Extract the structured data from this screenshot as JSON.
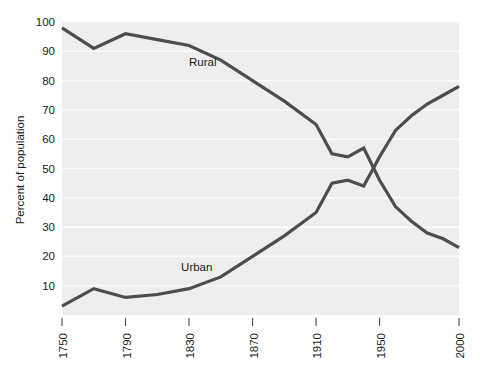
{
  "chart_data": {
    "type": "line",
    "title": "",
    "subtitle": "",
    "xlabel": "",
    "ylabel": "Percent of population",
    "xlim": [
      1750,
      2000
    ],
    "ylim": [
      0,
      100
    ],
    "grid": true,
    "legend_position": "inline-annotations",
    "x_ticks": [
      1750,
      1790,
      1830,
      1870,
      1910,
      1950,
      2000
    ],
    "x_tick_labels": [
      "1750",
      "1790",
      "1830",
      "1870",
      "1910",
      "1950",
      "2000"
    ],
    "y_ticks": [
      10,
      20,
      30,
      40,
      50,
      60,
      70,
      80,
      90,
      100
    ],
    "y_tick_labels": [
      "10",
      "20",
      "30",
      "40",
      "50",
      "60",
      "70",
      "80",
      "90",
      "100"
    ],
    "annotations": [
      {
        "text": "Rural",
        "x": 1830,
        "y": 85
      },
      {
        "text": "Urban",
        "x": 1825,
        "y": 15
      }
    ],
    "series": [
      {
        "name": "Rural",
        "label": "Rural",
        "color": "#4d4d4d",
        "x": [
          1750,
          1770,
          1790,
          1810,
          1830,
          1850,
          1870,
          1890,
          1910,
          1920,
          1930,
          1940,
          1950,
          1960,
          1970,
          1980,
          1990,
          2000
        ],
        "values": [
          98,
          91,
          96,
          94,
          92,
          87,
          80,
          73,
          65,
          55,
          54,
          57,
          46,
          37,
          32,
          28,
          26,
          23
        ]
      },
      {
        "name": "Urban",
        "label": "Urban",
        "color": "#4d4d4d",
        "x": [
          1750,
          1770,
          1790,
          1810,
          1830,
          1850,
          1870,
          1890,
          1910,
          1920,
          1930,
          1940,
          1950,
          1960,
          1970,
          1980,
          1990,
          2000
        ],
        "values": [
          3,
          9,
          6,
          7,
          9,
          13,
          20,
          27,
          35,
          45,
          46,
          44,
          54,
          63,
          68,
          72,
          75,
          78
        ]
      }
    ]
  },
  "axis": {
    "y_title": "Percent of population"
  },
  "colors": {
    "line": "#4d4d4d",
    "plot_background": "#eeeeee",
    "gridline": "#fbfbfb",
    "text": "#1a1a1a",
    "page_background": "#ffffff"
  }
}
